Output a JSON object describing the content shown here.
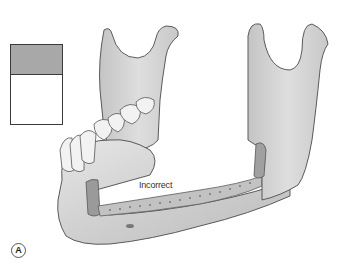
{
  "figure": {
    "annotation_label": "Incorrect",
    "panel_label": "A",
    "legend": {
      "top_fill": "#a8a8a8",
      "bottom_fill": "#ffffff",
      "border": "#3a3a3a"
    },
    "colors": {
      "bone_fill": "#d6d6d6",
      "bone_shade": "#bdbdbd",
      "outline": "#5a5a5a",
      "cut_surface": "#9a9a9a",
      "tooth_fill": "#f2f2f2"
    }
  }
}
